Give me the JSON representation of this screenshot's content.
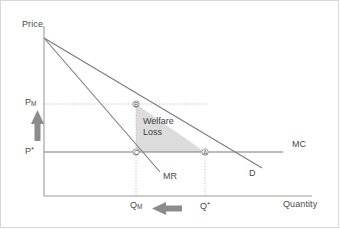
{
  "diagram": {
    "axes": {
      "y_label": "Price",
      "x_label": "Quantity"
    },
    "price_ticks": [
      {
        "id": "pm",
        "label": "P",
        "subscript": "M",
        "superscript": "",
        "y": 104
      },
      {
        "id": "pstar",
        "label": "P",
        "subscript": "",
        "superscript": "*",
        "y": 152
      }
    ],
    "quantity_ticks": [
      {
        "id": "qm",
        "label": "Q",
        "subscript": "M",
        "superscript": "",
        "x": 136
      },
      {
        "id": "qstar",
        "label": "Q",
        "subscript": "",
        "superscript": "*",
        "x": 205
      }
    ],
    "curves": [
      {
        "id": "demand",
        "label": "D",
        "label_x": 249,
        "label_y": 175
      },
      {
        "id": "marginal-revenue",
        "label": "MR",
        "label_x": 163,
        "label_y": 178
      },
      {
        "id": "marginal-cost",
        "label": "MC",
        "label_x": 292,
        "label_y": 146
      }
    ],
    "points": [
      {
        "id": "b",
        "label": "B",
        "x": 136,
        "y": 104
      },
      {
        "id": "c",
        "label": "C",
        "x": 136,
        "y": 152
      },
      {
        "id": "a",
        "label": "A",
        "x": 205,
        "y": 152
      }
    ],
    "region": {
      "id": "welfare-loss",
      "label_line1": "Welfare",
      "label_line2": "Loss",
      "fill": "#dcdcdc"
    },
    "arrows": [
      {
        "id": "price-up-arrow",
        "direction": "up"
      },
      {
        "id": "quantity-left-arrow",
        "direction": "left"
      }
    ],
    "colors": {
      "axis": "#8a8a8a",
      "curve": "#6e6e6e",
      "dotted": "#b8b8b8",
      "shade": "#dcdcdc",
      "arrow": "#8c8c8c",
      "text": "#4a4a4a",
      "frame": "#d8d8d8"
    }
  }
}
